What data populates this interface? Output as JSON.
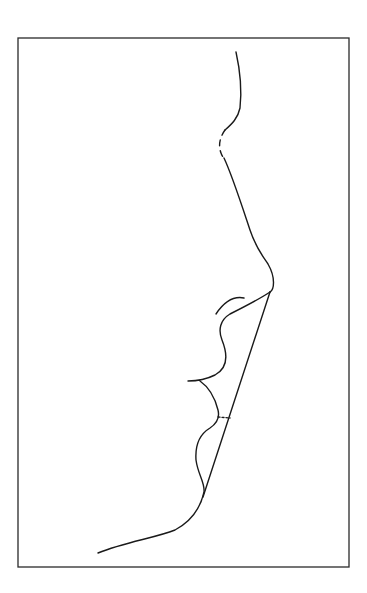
{
  "figure": {
    "line_color": "#1a1a1a",
    "background": "#ffffff",
    "elements": [
      "frame",
      "forehead-profile",
      "nasion-dashed-segment",
      "nasal-dorsum-profile",
      "nostril-ala",
      "lip-chin-profile",
      "aesthetic-line",
      "lip-distance-marker",
      "neck-profile"
    ]
  }
}
